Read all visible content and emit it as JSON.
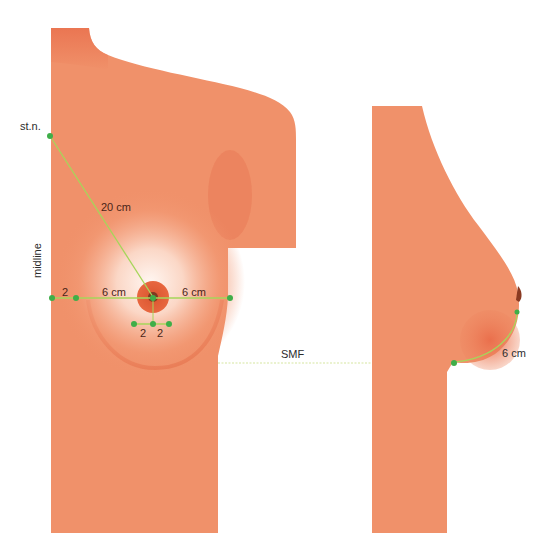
{
  "figure": {
    "type": "anatomical-measurement-diagram",
    "views": [
      "front-view",
      "side-view"
    ],
    "colors": {
      "skin": "#f0916a",
      "skin_dark": "#e86c4a",
      "highlight": "#fff3ee",
      "areola": "#e5603c",
      "nipple": "#8a3a22",
      "measure_line": "#a6d65a",
      "marker": "#3fae49",
      "text": "#3a2a22"
    }
  },
  "labels": {
    "sternal_notch": "st.n.",
    "midline": "midline",
    "sn_to_nipple": "20 cm",
    "midline_offset": "2",
    "medial_distance": "6 cm",
    "lateral_distance": "6 cm",
    "areola_left": "2",
    "areola_right": "2",
    "smf": "SMF",
    "nipple_to_imf": "6 cm"
  },
  "measurements": [
    {
      "name": "sternal-notch-to-nipple",
      "value": 20,
      "unit": "cm"
    },
    {
      "name": "midline-offset",
      "value": 2,
      "unit": "cm"
    },
    {
      "name": "nipple-to-medial",
      "value": 6,
      "unit": "cm"
    },
    {
      "name": "nipple-to-lateral",
      "value": 6,
      "unit": "cm"
    },
    {
      "name": "areola-radius-left",
      "value": 2,
      "unit": "cm"
    },
    {
      "name": "areola-radius-right",
      "value": 2,
      "unit": "cm"
    },
    {
      "name": "nipple-to-inframammary-fold",
      "value": 6,
      "unit": "cm"
    }
  ]
}
